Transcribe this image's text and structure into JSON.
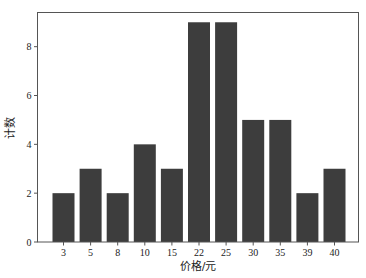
{
  "chart_data": {
    "type": "bar",
    "title": "",
    "xlabel": "价格/元",
    "ylabel": "计数",
    "categories": [
      "3",
      "5",
      "8",
      "10",
      "15",
      "22",
      "25",
      "30",
      "35",
      "39",
      "40"
    ],
    "values": [
      2,
      3,
      2,
      4,
      3,
      9,
      9,
      5,
      5,
      2,
      3
    ],
    "ylim": [
      0,
      9.4
    ],
    "yticks": [
      0,
      2,
      4,
      6,
      8
    ],
    "grid": false,
    "legend": null,
    "bar_color": "#3d3d3d",
    "axis_color": "#555555"
  }
}
